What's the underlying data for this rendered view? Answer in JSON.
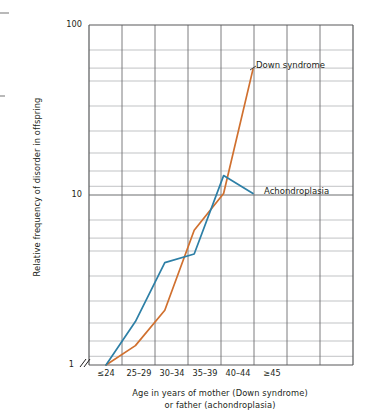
{
  "chart_data": {
    "type": "line",
    "title": "",
    "xlabel": "Age in years of mother (Down syndrome) or father (achondroplasia)",
    "xlabel_line1": "Age in years of mother (Down syndrome)",
    "xlabel_line2": "or father (achondroplasia)",
    "ylabel": "Relative frequency of disorder in offspring",
    "yscale": "log",
    "ylim": [
      1,
      100
    ],
    "ytick_labels": [
      "100",
      "10",
      "1"
    ],
    "ytick_values": [
      100,
      10,
      1
    ],
    "axis_break_marker": "//",
    "grid": true,
    "grid_minor": true,
    "legend_position": "inline-right",
    "categories": [
      "≤24",
      "25–29",
      "30–34",
      "35–39",
      "40–44",
      "≥45"
    ],
    "series": [
      {
        "name": "Down syndrome",
        "color": "#d0702f",
        "values": [
          1.0,
          1.3,
          2.1,
          6.2,
          10.2,
          55.0
        ]
      },
      {
        "name": "Achondroplasia",
        "color": "#2d7fa6",
        "values": [
          1.0,
          1.8,
          4.0,
          4.5,
          13.0,
          10.2
        ]
      }
    ]
  },
  "plot": {
    "frame_color": "#58595b",
    "grid_color": "#808285",
    "grid_minor_color": "#b5b7b9",
    "background": "#ffffff"
  }
}
